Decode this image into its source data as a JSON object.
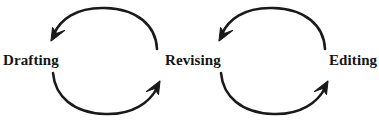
{
  "diagram": {
    "type": "cyclical-process",
    "title": "",
    "stroke_color": "#1a1a1a",
    "background_color": "#ffffff",
    "stages": [
      {
        "id": "drafting",
        "label": "Drafting"
      },
      {
        "id": "revising",
        "label": "Revising"
      },
      {
        "id": "editing",
        "label": "Editing"
      }
    ],
    "cycles": [
      {
        "id": "cycle-drafting-revising",
        "from": "Drafting",
        "to": "Revising",
        "arrows": [
          {
            "id": "top-arc",
            "direction": "right-to-left",
            "arrowhead": "down-left"
          },
          {
            "id": "bottom-arc",
            "direction": "left-to-right",
            "arrowhead": "up-right"
          }
        ]
      },
      {
        "id": "cycle-revising-editing",
        "from": "Revising",
        "to": "Editing",
        "arrows": [
          {
            "id": "top-arc",
            "direction": "right-to-left",
            "arrowhead": "down-left"
          },
          {
            "id": "bottom-arc",
            "direction": "left-to-right",
            "arrowhead": "up-right"
          }
        ]
      }
    ]
  }
}
